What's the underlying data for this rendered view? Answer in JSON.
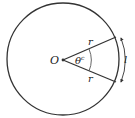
{
  "diagram": {
    "center_label": "O",
    "radius_label_top": "r",
    "radius_label_bottom": "r",
    "angle_label": "θ",
    "angle_superscript": "c",
    "arc_label": "l",
    "colors": {
      "stroke": "#333333",
      "background": "#ffffff"
    }
  }
}
